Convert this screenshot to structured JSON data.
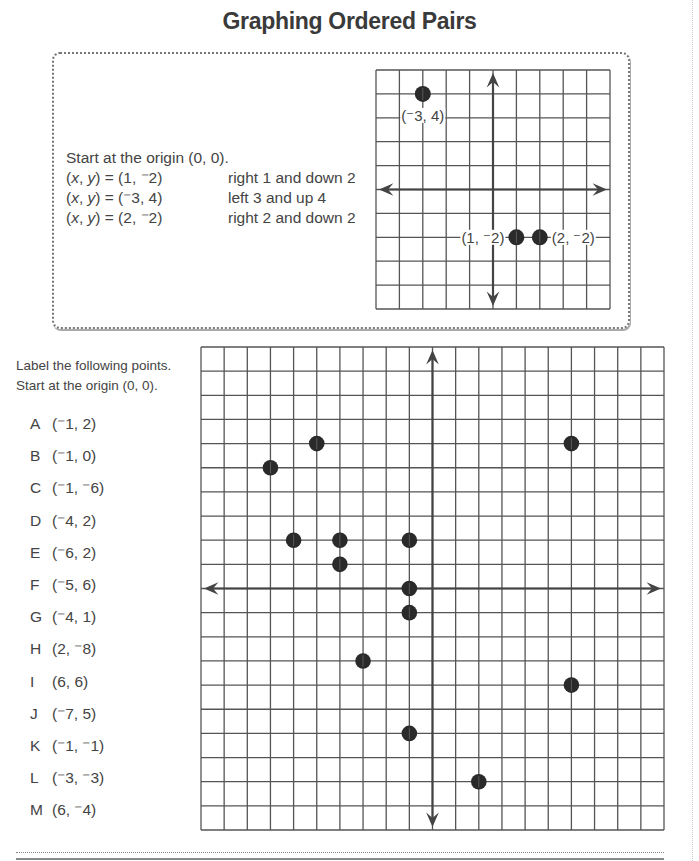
{
  "title": "Graphing Ordered Pairs",
  "example": {
    "intro": "Start at the origin (0, 0).",
    "rows": [
      {
        "lhs": "(x, y) = (1, ⁻2)",
        "desc": "right 1 and down 2"
      },
      {
        "lhs": "(x, y) = (⁻3, 4)",
        "desc": "left 3 and up 4"
      },
      {
        "lhs": "(x, y) = (2, ⁻2)",
        "desc": "right 2 and down 2"
      }
    ],
    "graph": {
      "cols": 10,
      "rows": 10,
      "x_range": [
        -5,
        5
      ],
      "y_range": [
        -5,
        5
      ],
      "points": [
        {
          "x": -3,
          "y": 4,
          "label": "(⁻3, 4)",
          "label_pos": "below"
        },
        {
          "x": 1,
          "y": -2,
          "label": "(1, ⁻2)",
          "label_pos": "left"
        },
        {
          "x": 2,
          "y": -2,
          "label": "(2, ⁻2)",
          "label_pos": "right"
        }
      ]
    }
  },
  "exercise": {
    "instructions": [
      "Label the following points.",
      "Start at the origin (0, 0)."
    ],
    "points": [
      {
        "letter": "A",
        "coord": "(⁻1, 2)",
        "x": -1,
        "y": 2
      },
      {
        "letter": "B",
        "coord": "(⁻1, 0)",
        "x": -1,
        "y": 0
      },
      {
        "letter": "C",
        "coord": "(⁻1, ⁻6)",
        "x": -1,
        "y": -6
      },
      {
        "letter": "D",
        "coord": "(⁻4, 2)",
        "x": -4,
        "y": 2
      },
      {
        "letter": "E",
        "coord": "(⁻6, 2)",
        "x": -6,
        "y": 2
      },
      {
        "letter": "F",
        "coord": "(⁻5, 6)",
        "x": -5,
        "y": 6
      },
      {
        "letter": "G",
        "coord": "(⁻4, 1)",
        "x": -4,
        "y": 1
      },
      {
        "letter": "H",
        "coord": "(2, ⁻8)",
        "x": 2,
        "y": -8
      },
      {
        "letter": "I",
        "coord": "(6, 6)",
        "x": 6,
        "y": 6
      },
      {
        "letter": "J",
        "coord": "(⁻7, 5)",
        "x": -7,
        "y": 5
      },
      {
        "letter": "K",
        "coord": "(⁻1, ⁻1)",
        "x": -1,
        "y": -1
      },
      {
        "letter": "L",
        "coord": "(⁻3, ⁻3)",
        "x": -3,
        "y": -3
      },
      {
        "letter": "M",
        "coord": "(6, ⁻4)",
        "x": 6,
        "y": -4
      }
    ],
    "graph": {
      "cols": 20,
      "rows": 20,
      "x_range": [
        -10,
        10
      ],
      "y_range": [
        -10,
        10
      ]
    }
  },
  "colors": {
    "grid": "#555555",
    "axis": "#444444",
    "dot": "#2a2a2a",
    "text": "#444444"
  }
}
